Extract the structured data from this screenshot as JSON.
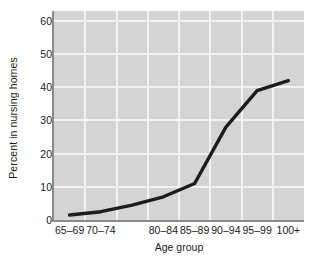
{
  "chart_data": {
    "type": "line",
    "title": "",
    "xlabel": "Age group",
    "ylabel": "Percent in nursing homes",
    "categories": [
      "65–69",
      "70–74",
      "75–79",
      "80–84",
      "85–89",
      "90–94",
      "95–99",
      "100+"
    ],
    "visible_tick_labels": [
      "65–69",
      "70–74",
      "80–84",
      "85–89",
      "90–94",
      "95–99",
      "100+"
    ],
    "values": [
      1.5,
      2.5,
      4.5,
      7,
      11,
      28,
      39,
      42
    ],
    "series": [
      {
        "name": "Percent in nursing homes",
        "values": [
          1.5,
          2.5,
          4.5,
          7,
          11,
          28,
          39,
          42
        ]
      }
    ],
    "ylim": [
      0,
      63
    ],
    "yticks": [
      0,
      10,
      20,
      30,
      40,
      50,
      60
    ],
    "ytick_labels": [
      "0",
      "10",
      "20",
      "30",
      "40",
      "50",
      "60"
    ],
    "grid": "both",
    "legend": "none",
    "colors": {
      "plot_background": "#d4d4d4",
      "gridline": "#f2f2f2",
      "axis_line": "#8a8a8a",
      "series_line": "#1c1c1c",
      "text": "#1a1a1a",
      "figure_background": "#ffffff"
    },
    "series_line_width": 3.4
  }
}
